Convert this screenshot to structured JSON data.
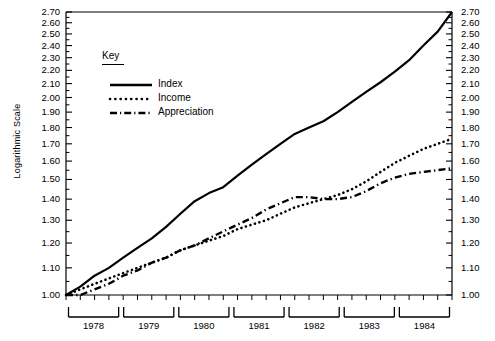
{
  "axes": {
    "y_title": "Logarithmic Scale",
    "y_ticks": [
      "1.00",
      "1.10",
      "1.20",
      "1.30",
      "1.40",
      "1.50",
      "1.60",
      "1.70",
      "1.80",
      "1.90",
      "2.00",
      "2.10",
      "2.20",
      "2.30",
      "2.40",
      "2.50",
      "2.60",
      "2.70"
    ],
    "x_years": [
      "1978",
      "1979",
      "1980",
      "1981",
      "1982",
      "1983",
      "1984"
    ]
  },
  "legend": {
    "title": "Key",
    "entries": [
      {
        "label": "Index",
        "style": "solid"
      },
      {
        "label": "Income",
        "style": "dotted"
      },
      {
        "label": "Appreciation",
        "style": "dash-dot"
      }
    ]
  },
  "chart_data": {
    "type": "line",
    "title": "",
    "xlabel": "",
    "ylabel": "Logarithmic Scale",
    "scale": "log",
    "ylim": [
      1.0,
      2.7
    ],
    "grid": false,
    "legend_position": "inside-top-left",
    "x": [
      "1978Q1",
      "1978Q2",
      "1978Q3",
      "1978Q4",
      "1979Q1",
      "1979Q2",
      "1979Q3",
      "1979Q4",
      "1980Q1",
      "1980Q2",
      "1980Q3",
      "1980Q4",
      "1981Q1",
      "1981Q2",
      "1981Q3",
      "1981Q4",
      "1982Q1",
      "1982Q2",
      "1982Q3",
      "1982Q4",
      "1983Q1",
      "1983Q2",
      "1983Q3",
      "1983Q4",
      "1984Q1",
      "1984Q2",
      "1984Q3",
      "1984Q4"
    ],
    "series": [
      {
        "name": "Index",
        "style": "solid",
        "values": [
          1.0,
          1.03,
          1.07,
          1.1,
          1.14,
          1.18,
          1.22,
          1.27,
          1.33,
          1.39,
          1.43,
          1.46,
          1.52,
          1.58,
          1.64,
          1.7,
          1.76,
          1.8,
          1.84,
          1.9,
          1.97,
          2.04,
          2.11,
          2.19,
          2.28,
          2.4,
          2.52,
          2.7
        ]
      },
      {
        "name": "Income",
        "style": "dotted",
        "values": [
          1.0,
          1.02,
          1.04,
          1.06,
          1.08,
          1.1,
          1.12,
          1.14,
          1.17,
          1.19,
          1.21,
          1.23,
          1.26,
          1.28,
          1.3,
          1.33,
          1.36,
          1.38,
          1.4,
          1.42,
          1.45,
          1.49,
          1.54,
          1.59,
          1.63,
          1.67,
          1.7,
          1.73
        ]
      },
      {
        "name": "Appreciation",
        "style": "dash-dot",
        "values": [
          1.0,
          1.0,
          1.02,
          1.04,
          1.07,
          1.09,
          1.12,
          1.14,
          1.17,
          1.19,
          1.22,
          1.25,
          1.28,
          1.31,
          1.35,
          1.38,
          1.41,
          1.41,
          1.4,
          1.4,
          1.41,
          1.44,
          1.48,
          1.51,
          1.53,
          1.54,
          1.55,
          1.56
        ]
      }
    ]
  }
}
